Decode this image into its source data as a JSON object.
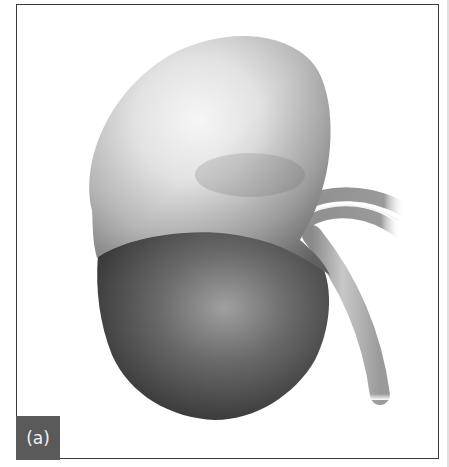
{
  "figure": {
    "panel_label": "(a)",
    "colors": {
      "frame_border": "#3a3a3a",
      "label_background": "#5a5a5a",
      "label_text": "#f2f2f2",
      "adrenal_light": "#f4f4f4",
      "adrenal_shadow": "#8a8a8a",
      "kidney_dark": "#3c3c3c",
      "kidney_highlight": "#9a9a9a",
      "vessel_gray": "#a8a8a8"
    }
  }
}
